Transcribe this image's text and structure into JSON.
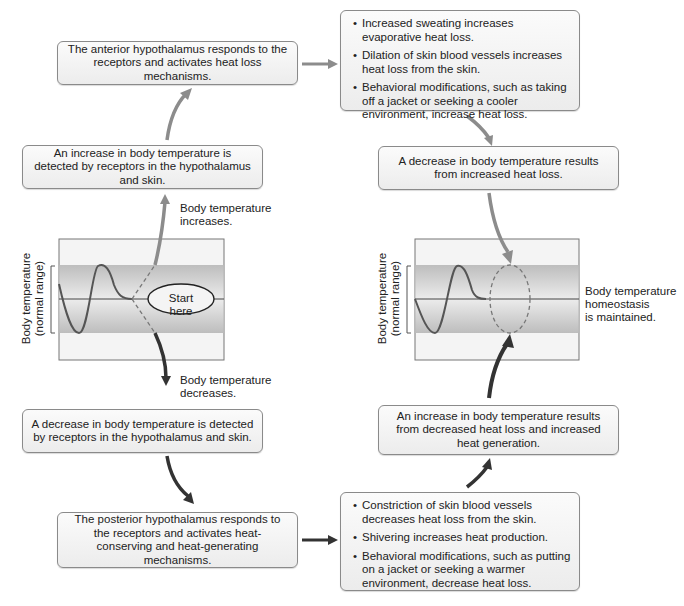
{
  "left_loop": {
    "anterior_box": "The anterior hypothalamus responds to the receptors and activates heat loss mechanisms.",
    "increase_detected_box": "An increase in body temperature is detected by receptors in the hypothalamus and skin.",
    "increases_label_1": "Body temperature",
    "increases_label_2": "increases.",
    "decreases_label_1": "Body temperature",
    "decreases_label_2": "decreases.",
    "decrease_detected_box": "A decrease in body temperature is detected by receptors in the hypothalamus and skin.",
    "posterior_box": "The posterior hypothalamus responds to the receptors and activates heat-conserving and heat-generating mechanisms.",
    "start_label": "Start here",
    "graph_ylabel_1": "Body temperature",
    "graph_ylabel_2": "(normal range)"
  },
  "right_loop": {
    "heat_loss_list": [
      "Increased sweating increases evaporative heat loss.",
      "Dilation of skin blood vessels increases heat loss from the skin.",
      "Behavioral modifications, such as taking off a jacket or seeking a cooler environment, increase heat loss."
    ],
    "decrease_result_box": "A decrease in body temperature results from increased heat loss.",
    "homeostasis_label_1": "Body temperature",
    "homeostasis_label_2": "homeostasis",
    "homeostasis_label_3": "is maintained.",
    "increase_result_box": "An increase in body temperature results from decreased heat loss and increased heat generation.",
    "heat_gain_list": [
      "Constriction of skin blood vessels decreases heat loss from the skin.",
      "Shivering increases heat production.",
      "Behavioral modifications, such as putting on a jacket or seeking a warmer environment, decrease heat loss."
    ],
    "graph_ylabel_1": "Body temperature",
    "graph_ylabel_2": "(normal range)"
  },
  "colors": {
    "warm_arrow": "#8c8c8c",
    "cold_arrow": "#333333",
    "band": "#c8c8c8",
    "box_border": "#8a8a8a"
  }
}
